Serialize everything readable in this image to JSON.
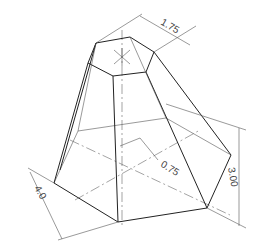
{
  "drawing": {
    "type": "isometric frustum of hexagonal pyramid",
    "dimensions": {
      "top_flat": "1.75",
      "base_width": "4.0",
      "height": "3.00",
      "offset": "0.75"
    }
  }
}
